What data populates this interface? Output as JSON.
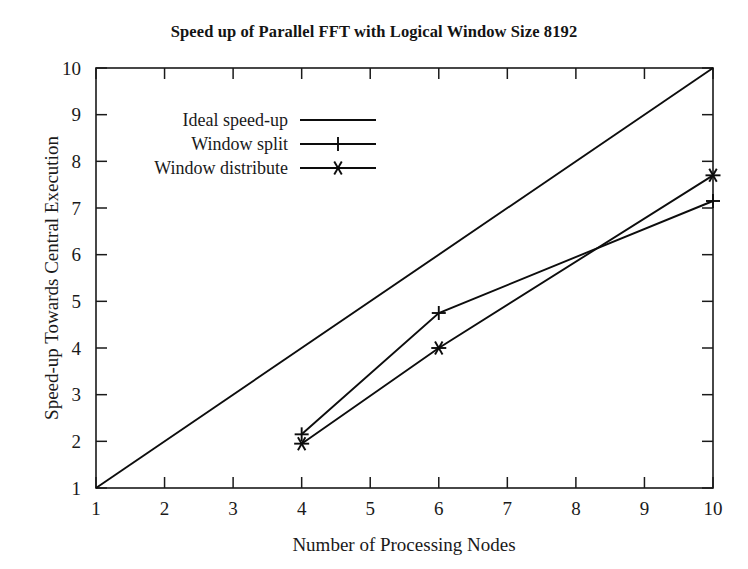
{
  "chart_data": {
    "type": "line",
    "title": "Speed up of Parallel FFT with Logical Window Size 8192",
    "xlabel": "Number of Processing Nodes",
    "ylabel": "Speed-up Towards Central Execution",
    "xlim": [
      1,
      10
    ],
    "ylim": [
      1,
      10
    ],
    "xticks": [
      "1",
      "2",
      "3",
      "4",
      "5",
      "6",
      "7",
      "8",
      "9",
      "10"
    ],
    "yticks": [
      "1",
      "2",
      "3",
      "4",
      "5",
      "6",
      "7",
      "8",
      "9",
      "10"
    ],
    "grid": false,
    "legend_position": "upper-left",
    "series": [
      {
        "name": "Ideal speed-up",
        "marker": "none",
        "x": [
          1,
          10
        ],
        "values": [
          1,
          10
        ]
      },
      {
        "name": "Window split",
        "marker": "plus",
        "x": [
          4,
          6,
          10
        ],
        "values": [
          2.15,
          4.75,
          7.15
        ]
      },
      {
        "name": "Window distribute",
        "marker": "asterisk",
        "x": [
          4,
          6,
          10
        ],
        "values": [
          1.95,
          4.0,
          7.7
        ]
      }
    ]
  },
  "legend": {
    "items": [
      {
        "label": "Ideal speed-up"
      },
      {
        "label": "Window split"
      },
      {
        "label": "Window distribute"
      }
    ]
  }
}
